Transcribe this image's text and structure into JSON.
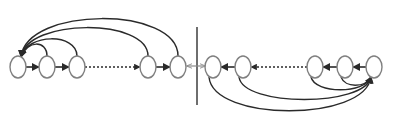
{
  "diagram": {
    "width": 393,
    "height": 126,
    "colors": {
      "background": "#ffffff",
      "node_stroke": "#808080",
      "edge": "#2a2a2a",
      "divider": "#6e6e6e",
      "center_arrow": "#8a8a8a"
    },
    "node_rx": 8,
    "node_ry": 11,
    "node_y": 67,
    "left_chain": {
      "nodes_x": [
        18,
        47,
        77,
        148,
        178
      ],
      "direction": "right",
      "dotted_between": [
        2,
        3
      ],
      "arcs_to_first": [
        {
          "from": 1,
          "peak_y": 42
        },
        {
          "from": 2,
          "peak_y": 35
        },
        {
          "from": 3,
          "peak_y": 20
        },
        {
          "from": 4,
          "peak_y": 8
        }
      ]
    },
    "right_chain": {
      "nodes_x": [
        213,
        243,
        315,
        345,
        374
      ],
      "direction": "left",
      "dotted_between": [
        1,
        2
      ],
      "arcs_to_last": [
        {
          "from": 3,
          "peak_y": 86
        },
        {
          "from": 2,
          "peak_y": 92
        },
        {
          "from": 1,
          "peak_y": 105
        },
        {
          "from": 0,
          "peak_y": 120
        }
      ]
    },
    "divider": {
      "x": 197,
      "y1": 27,
      "y2": 105
    },
    "center_link": {
      "x1": 187,
      "x2": 205,
      "y": 66,
      "bidirectional": true
    }
  }
}
